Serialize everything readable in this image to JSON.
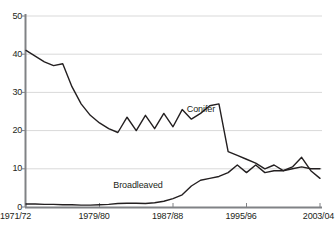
{
  "chart_data": {
    "type": "line",
    "title": "",
    "subtitle": "",
    "xlabel": "",
    "ylabel": "",
    "xlim": [
      1971,
      2003
    ],
    "ylim": [
      0,
      50
    ],
    "grid": true,
    "legend_position": "inline-annotation",
    "x": [
      1971,
      1972,
      1973,
      1974,
      1975,
      1976,
      1977,
      1978,
      1979,
      1980,
      1981,
      1982,
      1983,
      1984,
      1985,
      1986,
      1987,
      1988,
      1989,
      1990,
      1991,
      1992,
      1993,
      1994,
      1995,
      1996,
      1997,
      1998,
      1999,
      2000,
      2001,
      2002,
      2003
    ],
    "x_tick_values": [
      1971,
      1979,
      1987,
      1995,
      2003
    ],
    "x_tick_labels": [
      "1971/72",
      "1979/80",
      "1987/88",
      "1995/96",
      "2003/04"
    ],
    "y_tick_values": [
      0,
      10,
      20,
      30,
      40,
      50
    ],
    "y_tick_labels": [
      "0",
      "10",
      "20",
      "30",
      "40",
      "50"
    ],
    "series": [
      {
        "name": "Conifer",
        "label": "Conifer",
        "color": "#231f20",
        "label_x": 1988.5,
        "label_y": 25.5,
        "values": [
          41.0,
          39.5,
          38.0,
          37.0,
          37.5,
          31.5,
          27.0,
          24.0,
          22.0,
          20.5,
          19.5,
          23.5,
          20.0,
          24.0,
          20.5,
          24.5,
          21.0,
          25.5,
          23.0,
          24.5,
          26.5,
          27.0,
          14.5,
          13.5,
          12.5,
          11.5,
          10.0,
          11.0,
          9.5,
          10.0,
          10.5,
          10.0,
          10.0
        ]
      },
      {
        "name": "Broadleaved",
        "label": "Broadleaved",
        "color": "#231f20",
        "label_x": 1980.5,
        "label_y": 5.5,
        "values": [
          0.8,
          0.8,
          0.7,
          0.7,
          0.6,
          0.6,
          0.5,
          0.5,
          0.6,
          0.7,
          0.9,
          1.0,
          1.0,
          0.9,
          1.1,
          1.5,
          2.2,
          3.2,
          5.5,
          7.0,
          7.5,
          8.0,
          9.0,
          11.0,
          9.0,
          11.0,
          9.0,
          9.5,
          9.5,
          10.5,
          13.0,
          9.5,
          7.5
        ]
      }
    ]
  },
  "axis": {
    "y_axis_color": "#808285",
    "x_axis_color": "#808285",
    "gridline_color": "#d9d9d9"
  }
}
